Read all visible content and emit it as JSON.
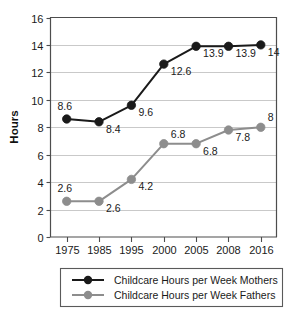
{
  "chart_data": {
    "type": "line",
    "title": "",
    "xlabel": "",
    "ylabel": "Hours",
    "categories": [
      "1975",
      "1985",
      "1995",
      "2000",
      "2005",
      "2008",
      "2016"
    ],
    "ylim": [
      0,
      16
    ],
    "ytick_step": 2,
    "yticks": [
      "0",
      "2",
      "4",
      "6",
      "8",
      "10",
      "12",
      "14",
      "16"
    ],
    "grid": "horizontal",
    "legend_position": "bottom",
    "series": [
      {
        "name": "Childcare Hours per Week Mothers",
        "color": "#1a1a1a",
        "marker": "circle",
        "values": [
          8.6,
          8.4,
          9.6,
          12.6,
          13.9,
          13.9,
          14
        ],
        "labels": [
          "8.6",
          "8.4",
          "9.6",
          "12.6",
          "13.9",
          "13.9",
          "14"
        ],
        "label_anchor": [
          "above-left",
          "below-right",
          "below-right",
          "below-right",
          "below-right",
          "below-right",
          "below-right"
        ]
      },
      {
        "name": "Childcare Hours per Week Fathers",
        "color": "#8d8d8d",
        "marker": "circle",
        "values": [
          2.6,
          2.6,
          4.2,
          6.8,
          6.8,
          7.8,
          8
        ],
        "labels": [
          "2.6",
          "2.6",
          "4.2",
          "6.8",
          "6.8",
          "7.8",
          "8"
        ],
        "label_anchor": [
          "above-left",
          "below-right",
          "below-right",
          "above-right",
          "below-right",
          "below-right",
          "above-right"
        ]
      }
    ]
  },
  "legend": {
    "items": [
      {
        "label": "Childcare Hours per Week Mothers",
        "color": "#1a1a1a"
      },
      {
        "label": "Childcare Hours per Week Fathers",
        "color": "#8d8d8d"
      }
    ]
  },
  "axis": {
    "y_title": "Hours"
  }
}
